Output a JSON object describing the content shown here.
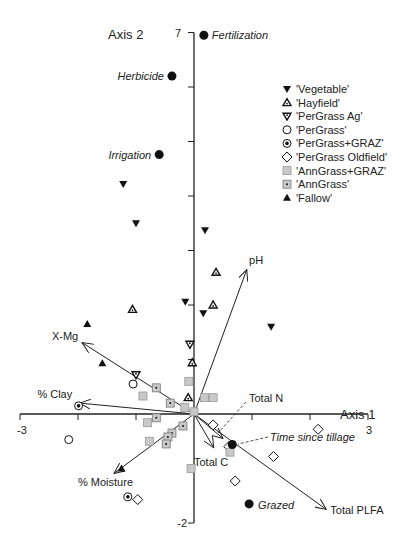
{
  "chart_data": {
    "type": "scatter",
    "title": "",
    "xlabel": "Axis 1",
    "ylabel": "Axis 2",
    "xlim": [
      -3,
      3
    ],
    "ylim": [
      -2,
      7
    ],
    "x_tick_labels": [
      "-3",
      "3"
    ],
    "y_tick_labels": [
      "7",
      "-2"
    ],
    "x_ticks": [
      -3,
      -2,
      -1,
      0,
      1,
      2,
      3
    ],
    "y_ticks": [
      -2,
      -1,
      0,
      1,
      2,
      3,
      4,
      5,
      6,
      7
    ],
    "grid": false,
    "legend_position": "upper right",
    "legend": [
      {
        "label": "'Vegetable'",
        "marker": "triangle-down-filled"
      },
      {
        "label": "'Hayfield'",
        "marker": "triangle-up-dotted"
      },
      {
        "label": "'PerGrass Ag'",
        "marker": "triangle-down-dotted"
      },
      {
        "label": "'PerGrass'",
        "marker": "circle-open"
      },
      {
        "label": "'PerGrass+GRAZ'",
        "marker": "circle-dotted"
      },
      {
        "label": "'PerGrass Oldfield'",
        "marker": "diamond-open"
      },
      {
        "label": "'AnnGrass+GRAZ'",
        "marker": "square-gray"
      },
      {
        "label": "'AnnGrass'",
        "marker": "square-dotted"
      },
      {
        "label": "'Fallow'",
        "marker": "triangle-up-filled"
      }
    ],
    "series": [
      {
        "name": "'Vegetable'",
        "marker": "triangle-down-filled",
        "points": [
          [
            -1.22,
            4.22
          ],
          [
            -1.0,
            3.5
          ],
          [
            -0.15,
            2.06
          ],
          [
            0.19,
            3.37
          ],
          [
            0.16,
            1.85
          ],
          [
            1.33,
            1.6
          ]
        ]
      },
      {
        "name": "'Hayfield'",
        "marker": "triangle-up-dotted",
        "points": [
          [
            -1.06,
            1.92
          ],
          [
            0.38,
            2.6
          ],
          [
            0.33,
            2.0
          ],
          [
            -0.03,
            0.94
          ],
          [
            -0.1,
            0.3
          ]
        ]
      },
      {
        "name": "'PerGrass Ag'",
        "marker": "triangle-down-dotted",
        "points": [
          [
            -0.07,
            1.28
          ],
          [
            -1.0,
            0.72
          ]
        ]
      },
      {
        "name": "'PerGrass'",
        "marker": "circle-open",
        "points": [
          [
            -2.16,
            -0.47
          ],
          [
            -1.05,
            0.55
          ]
        ]
      },
      {
        "name": "'PerGrass+GRAZ'",
        "marker": "circle-dotted",
        "points": [
          [
            -1.99,
            0.15
          ],
          [
            -1.14,
            -1.52
          ]
        ]
      },
      {
        "name": "'PerGrass Oldfield'",
        "marker": "diamond-open",
        "points": [
          [
            0.33,
            -0.2
          ],
          [
            2.14,
            -0.28
          ],
          [
            1.37,
            -0.78
          ],
          [
            0.71,
            -1.23
          ],
          [
            -0.97,
            -1.57
          ],
          [
            0.6,
            -0.6
          ]
        ]
      },
      {
        "name": "'AnnGrass+GRAZ'",
        "marker": "square-gray",
        "points": [
          [
            -0.88,
            0.33
          ],
          [
            -0.09,
            0.6
          ],
          [
            -0.16,
            0.12
          ],
          [
            -0.8,
            -0.16
          ],
          [
            0.18,
            0.3
          ],
          [
            0.33,
            0.3
          ],
          [
            -0.05,
            -1.0
          ],
          [
            -0.77,
            -0.5
          ],
          [
            0.0,
            0.04
          ],
          [
            0.62,
            -0.7
          ]
        ]
      },
      {
        "name": "'AnnGrass'",
        "marker": "square-dotted",
        "points": [
          [
            -0.65,
            0.48
          ],
          [
            -0.41,
            0.2
          ],
          [
            -0.65,
            -0.07
          ],
          [
            -0.19,
            -0.22
          ],
          [
            -0.38,
            -0.35
          ],
          [
            -0.45,
            -0.42
          ],
          [
            -0.48,
            -0.55
          ]
        ]
      },
      {
        "name": "'Fallow'",
        "marker": "triangle-up-filled",
        "points": [
          [
            -1.84,
            1.65
          ],
          [
            -1.58,
            0.93
          ],
          [
            -1.25,
            -1.0
          ]
        ]
      }
    ],
    "factor_points": [
      {
        "label": "Fertilization",
        "x": 0.17,
        "y": 6.95
      },
      {
        "label": "Herbicide",
        "x": -0.38,
        "y": 6.2
      },
      {
        "label": "Irrigation",
        "x": -0.6,
        "y": 4.76
      },
      {
        "label": "Time since tillage",
        "x": 0.66,
        "y": -0.56
      },
      {
        "label": "Grazed",
        "x": 0.95,
        "y": -1.65
      }
    ],
    "vectors": [
      {
        "label": "pH",
        "x": 0.91,
        "y": 2.65,
        "style": "solid"
      },
      {
        "label": "X-Mg",
        "x": -1.93,
        "y": 1.31,
        "style": "solid"
      },
      {
        "label": "% Clay",
        "x": -1.97,
        "y": 0.2,
        "style": "solid"
      },
      {
        "label": "% Moisture",
        "x": -1.38,
        "y": -1.09,
        "style": "solid"
      },
      {
        "label": "Total PLFA",
        "x": 2.28,
        "y": -1.75,
        "style": "solid"
      },
      {
        "label": "Total C",
        "x": 0.34,
        "y": -0.62,
        "style": "solid"
      },
      {
        "label": "Total N",
        "x": 0.5,
        "y": -0.45,
        "style": "solid"
      }
    ]
  },
  "labels": {
    "axis2": "Axis 2",
    "axis1": "Axis 1",
    "y_top": "7",
    "y_bottom": "-2",
    "x_left": "-3",
    "x_right": "3",
    "total_n": "Total N",
    "time_since_tillage": "Time since tillage"
  }
}
